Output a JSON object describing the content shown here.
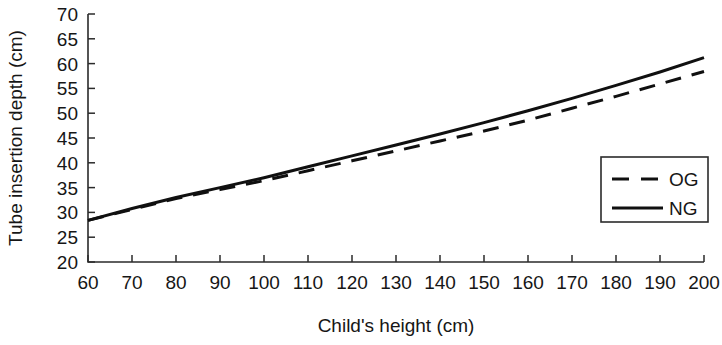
{
  "chart_data": {
    "type": "line",
    "title": "",
    "xlabel": "Child's height (cm)",
    "ylabel": "Tube insertion depth (cm)",
    "xlim": [
      60,
      200
    ],
    "ylim": [
      20,
      70
    ],
    "xticks": [
      60,
      70,
      80,
      90,
      100,
      110,
      120,
      130,
      140,
      150,
      160,
      170,
      180,
      190,
      200
    ],
    "yticks": [
      20,
      25,
      30,
      35,
      40,
      45,
      50,
      55,
      60,
      65,
      70
    ],
    "xtick_labels": [
      "60",
      "70",
      "80",
      "90",
      "100",
      "110",
      "120",
      "130",
      "140",
      "150",
      "160",
      "170",
      "180",
      "190",
      "200"
    ],
    "ytick_labels": [
      "20",
      "25",
      "30",
      "35",
      "40",
      "45",
      "50",
      "55",
      "60",
      "65",
      "70"
    ],
    "grid": false,
    "legend_position": "lower-right",
    "x": [
      60,
      70,
      80,
      90,
      100,
      110,
      120,
      130,
      140,
      150,
      160,
      170,
      180,
      190,
      200
    ],
    "series": [
      {
        "name": "OG",
        "style": "dashed",
        "color": "#101010",
        "values": [
          28.4,
          30.6,
          32.8,
          34.6,
          36.4,
          38.4,
          40.4,
          42.4,
          44.4,
          46.4,
          48.6,
          51.0,
          53.4,
          55.9,
          58.4
        ]
      },
      {
        "name": "NG",
        "style": "solid",
        "color": "#101010",
        "values": [
          28.4,
          30.8,
          33.0,
          35.0,
          37.0,
          39.2,
          41.4,
          43.6,
          45.8,
          48.1,
          50.5,
          53.0,
          55.6,
          58.3,
          61.2
        ]
      }
    ]
  },
  "legend": {
    "entries": [
      {
        "label": "OG"
      },
      {
        "label": "NG"
      }
    ]
  }
}
